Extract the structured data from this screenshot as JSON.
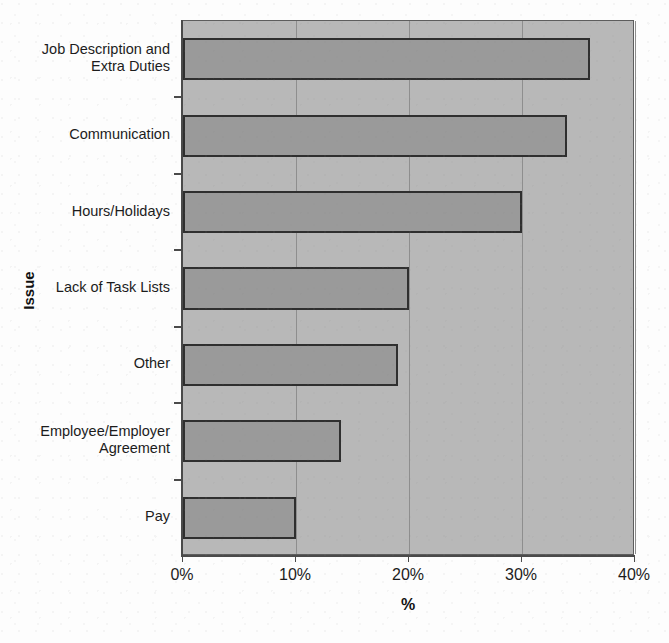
{
  "figure": {
    "title_remnant": "",
    "background_color": "#fdfdfd",
    "plot_background_color": "#b8b8b8",
    "bar_fill_color": "#9a9a9a",
    "bar_border_color": "#2f2f2f",
    "gridline_color": "#8e8e8e",
    "axis_color": "#4a4a4a"
  },
  "chart_data": {
    "type": "bar",
    "orientation": "horizontal",
    "title": "",
    "xlabel": "%",
    "ylabel": "Issue",
    "xlim": [
      0,
      40
    ],
    "xtick_labels": [
      "0%",
      "10%",
      "20%",
      "30%",
      "40%"
    ],
    "xtick_values": [
      0,
      10,
      20,
      30,
      40
    ],
    "grid": true,
    "grid_axis": "x",
    "legend": false,
    "categories": [
      "Job Description and Extra Duties",
      "Communication",
      "Hours/Holidays",
      "Lack of Task Lists",
      "Other",
      "Employee/Employer Agreement",
      "Pay"
    ],
    "category_lines": [
      [
        "Job Description and",
        "Extra Duties"
      ],
      [
        "Communication"
      ],
      [
        "Hours/Holidays"
      ],
      [
        "Lack of Task Lists"
      ],
      [
        "Other"
      ],
      [
        "Employee/Employer",
        "Agreement"
      ],
      [
        "Pay"
      ]
    ],
    "values": [
      36,
      34,
      30,
      20,
      19,
      14,
      10
    ],
    "value_labels": [
      "36%",
      "34%",
      "30%",
      "20%",
      "19%",
      "14%",
      "10%"
    ]
  }
}
